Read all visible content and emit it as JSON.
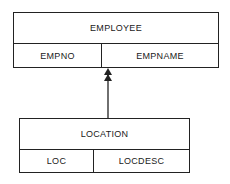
{
  "diagram": {
    "parent": {
      "title": "EMPLOYEE",
      "fields": [
        "EMPNO",
        "EMPNAME"
      ]
    },
    "child": {
      "title": "LOCATION",
      "fields": [
        "LOC",
        "LOCDESC"
      ]
    },
    "relationship": {
      "type": "one-to-many",
      "from": "LOCATION",
      "to": "EMPLOYEE",
      "arrow": "double-arrowhead"
    }
  }
}
